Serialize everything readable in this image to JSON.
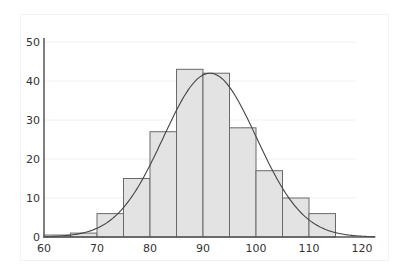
{
  "chart_data": {
    "type": "bar",
    "subtype": "histogram_with_normal_curve",
    "title": "",
    "xlabel": "",
    "ylabel": "",
    "bin_width": 5,
    "bins": [
      {
        "start": 60,
        "end": 65,
        "count": 0.5
      },
      {
        "start": 65,
        "end": 70,
        "count": 1
      },
      {
        "start": 70,
        "end": 75,
        "count": 6
      },
      {
        "start": 75,
        "end": 80,
        "count": 15
      },
      {
        "start": 80,
        "end": 85,
        "count": 27
      },
      {
        "start": 85,
        "end": 90,
        "count": 43
      },
      {
        "start": 90,
        "end": 95,
        "count": 42
      },
      {
        "start": 95,
        "end": 100,
        "count": 28
      },
      {
        "start": 100,
        "end": 105,
        "count": 17
      },
      {
        "start": 105,
        "end": 110,
        "count": 10
      },
      {
        "start": 110,
        "end": 115,
        "count": 6
      }
    ],
    "categories": [
      "60-65",
      "65-70",
      "70-75",
      "75-80",
      "80-85",
      "85-90",
      "90-95",
      "95-100",
      "100-105",
      "105-110",
      "110-115"
    ],
    "values": [
      0.5,
      1,
      6,
      15,
      27,
      43,
      42,
      28,
      17,
      10,
      6
    ],
    "normal_curve": {
      "mean": 91.3,
      "sd": 8.8,
      "peak": 42
    },
    "xlim": [
      60,
      122.5
    ],
    "ylim": [
      0,
      51
    ],
    "x_ticks": [
      60,
      70,
      80,
      90,
      100,
      110,
      120
    ],
    "y_ticks": [
      0,
      10,
      20,
      30,
      40,
      50
    ],
    "grid": true,
    "legend": null
  },
  "colors": {
    "bar_fill": "#e3e3e3",
    "bar_stroke": "#6a6a6a",
    "curve": "#444444",
    "axis": "#555555",
    "grid": "#f0f0f0"
  }
}
